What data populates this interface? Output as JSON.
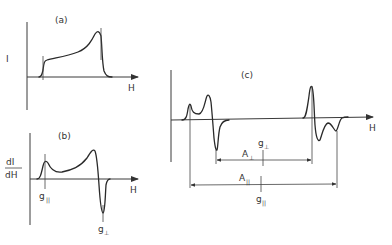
{
  "figure": {
    "panels": [
      {
        "id": "a",
        "label": "(a)",
        "y_axis_label": "I",
        "x_axis_label": "H",
        "description": "Absorption envelope: rises at g-parallel, slowly increases to a maximum at g-perpendicular, then drops to baseline"
      },
      {
        "id": "b",
        "label": "(b)",
        "y_axis_label_num": "dI",
        "y_axis_label_den": "dH",
        "x_axis_label": "H",
        "markers": [
          {
            "label": "g",
            "subscript": "||"
          },
          {
            "label": "g",
            "subscript": "⊥"
          }
        ],
        "description": "First-derivative spectrum: positive peak at g-parallel, broad rise, sharp negative trough at g-perpendicular"
      },
      {
        "id": "c",
        "label": "(c)",
        "x_axis_label": "H",
        "annotations": {
          "A_perp": {
            "label": "A",
            "subscript": "⊥"
          },
          "A_par": {
            "label": "A",
            "subscript": "||"
          },
          "g_perp": {
            "label": "g",
            "subscript": "⊥"
          },
          "g_par": {
            "label": "g",
            "subscript": "||"
          }
        },
        "description": "Derivative spectrum with hyperfine splitting: two doublet groups separated by A-perpendicular and A-parallel, centered at g-perpendicular and g-parallel"
      }
    ]
  }
}
